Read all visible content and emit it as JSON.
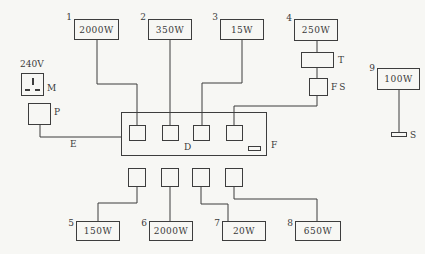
{
  "colors": {
    "background": "#f7f7f4",
    "line": "#3d3d3d",
    "text": "#3a3a3a"
  },
  "mains": {
    "voltage": "240V",
    "socket_label": "M",
    "plug_label": "P",
    "lead_label": "E"
  },
  "strip": {
    "label": "D",
    "right_label": "F"
  },
  "transformer": {
    "label": "T"
  },
  "fuse": {
    "label": "FS"
  },
  "appliances_top": [
    {
      "num": "1",
      "power": "2000W"
    },
    {
      "num": "2",
      "power": "350W"
    },
    {
      "num": "3",
      "power": "15W"
    },
    {
      "num": "4",
      "power": "250W"
    }
  ],
  "appliances_bottom": [
    {
      "num": "5",
      "power": "150W"
    },
    {
      "num": "6",
      "power": "2000W"
    },
    {
      "num": "7",
      "power": "20W"
    },
    {
      "num": "8",
      "power": "650W"
    }
  ],
  "lamp": {
    "num": "9",
    "power": "100W",
    "switch_label": "S"
  }
}
